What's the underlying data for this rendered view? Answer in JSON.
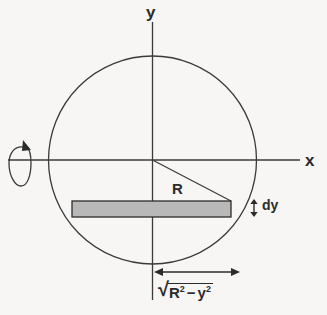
{
  "figure": {
    "axes": {
      "y_label": "y",
      "x_label": "x"
    },
    "labels": {
      "radius": "R",
      "thickness": "dy",
      "halfchord_radical": "√",
      "halfchord_R": "R",
      "halfchord_R_exp": "2",
      "halfchord_minus": "−",
      "halfchord_y": "y",
      "halfchord_y_exp": "2"
    },
    "icons": {
      "rotation": "rotation-arrow-icon",
      "dy_measure": "double-headed-vertical-arrow-icon",
      "chord_measure": "double-headed-horizontal-arrow-icon"
    },
    "geometry": {
      "center_x": 152.5,
      "center_y": 160,
      "circle_radius": 104,
      "strip_left": 72,
      "strip_right": 231,
      "strip_top": 201,
      "strip_bottom": 217
    },
    "colors": {
      "stroke": "#3a3a3a",
      "strip_fill": "#b8b8b8",
      "strip_stroke": "#2b2b2b",
      "background": "#f7f6f4",
      "text": "#2b2b2b"
    }
  }
}
